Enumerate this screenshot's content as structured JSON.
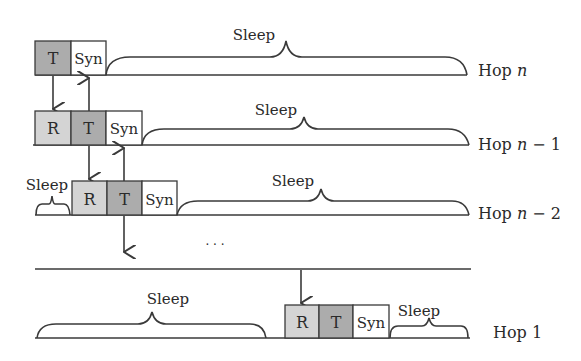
{
  "diagram": {
    "colors": {
      "transmit_fill": "#acacac",
      "receive_fill": "#d4d4d4",
      "sync_fill": "#ffffff",
      "line": "#3a3a3a"
    },
    "labels": {
      "transmit": "T",
      "receive": "R",
      "sync": "Syn",
      "sleep": "Sleep",
      "ellipsis": "· · ·"
    },
    "hops": [
      {
        "id": "hop-n",
        "prefix": "Hop ",
        "var": "n",
        "suffix": "",
        "slots": [
          "T",
          "Syn"
        ],
        "sleep_segments": [
          "Sleep"
        ]
      },
      {
        "id": "hop-n-1",
        "prefix": "Hop ",
        "var": "n",
        "suffix": " − 1",
        "slots": [
          "R",
          "T",
          "Syn"
        ],
        "sleep_segments": [
          "Sleep"
        ]
      },
      {
        "id": "hop-n-2",
        "prefix": "Hop ",
        "var": "n",
        "suffix": " − 2",
        "slots": [
          "R",
          "T",
          "Syn"
        ],
        "sleep_segments": [
          "Sleep",
          "Sleep"
        ]
      },
      {
        "id": "hop-1",
        "prefix": "Hop 1",
        "var": "",
        "suffix": "",
        "slots": [
          "R",
          "T",
          "Syn"
        ],
        "sleep_segments": [
          "Sleep",
          "Sleep"
        ]
      }
    ]
  }
}
